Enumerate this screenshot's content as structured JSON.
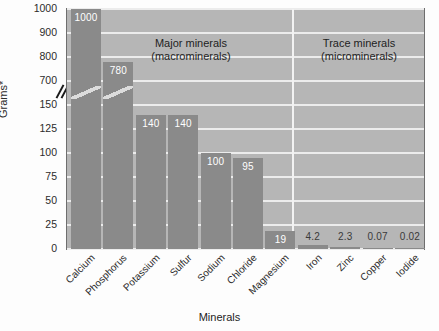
{
  "chart_data": {
    "type": "bar",
    "title": "",
    "xlabel": "Minerals",
    "ylabel": "Grams*",
    "categories": [
      "Calcium",
      "Phosphorus",
      "Potassium",
      "Sulfur",
      "Sodium",
      "Chloride",
      "Magnesium",
      "Iron",
      "Zinc",
      "Copper",
      "Iodide"
    ],
    "values": [
      1000,
      780,
      140,
      140,
      100,
      95,
      19,
      4.2,
      2.3,
      0.07,
      0.02
    ],
    "value_labels": [
      "1000",
      "780",
      "140",
      "140",
      "100",
      "95",
      "19",
      "4.2",
      "2.3",
      "0.07",
      "0.02"
    ],
    "yticks": [
      1000,
      900,
      800,
      700,
      150,
      125,
      100,
      75,
      50,
      25,
      0
    ],
    "ytick_labels": [
      "1000",
      "900",
      "800",
      "700",
      "150",
      "125",
      "100",
      "75",
      "50",
      "25",
      "0"
    ],
    "axis_break": {
      "present": true,
      "between": [
        700,
        150
      ]
    },
    "ylim": [
      0,
      1000
    ],
    "grid": true,
    "legend": "none",
    "annotations": [
      {
        "text": "Major minerals",
        "subtext": "(macrominerals)",
        "covers": [
          "Calcium",
          "Phosphorus",
          "Potassium",
          "Sulfur",
          "Sodium",
          "Chloride",
          "Magnesium"
        ]
      },
      {
        "text": "Trace minerals",
        "subtext": "(microminerals)",
        "covers": [
          "Iron",
          "Zinc",
          "Copper",
          "Iodide"
        ]
      }
    ],
    "colors": {
      "bar": "#8a8a8a",
      "plot_background": "#b6b6b6",
      "gridline": "#ececec",
      "bar_label": "#ffffff",
      "outside_label": "#3a3a3a",
      "axis": "#6e6e6e"
    }
  },
  "sections": {
    "major": {
      "line1": "Major minerals",
      "line2": "(macrominerals)"
    },
    "trace": {
      "line1": "Trace minerals",
      "line2": "(microminerals)"
    }
  },
  "axes": {
    "y_title": "Grams*",
    "x_title": "Minerals"
  }
}
